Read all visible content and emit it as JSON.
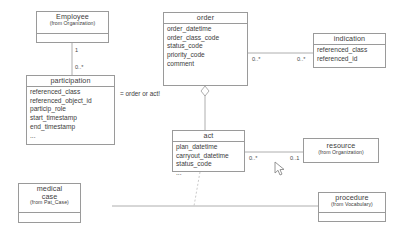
{
  "diagram": {
    "note": "= order or act!",
    "line_color": "#9a9a9a",
    "text_color": "#3c3c3c",
    "background": "#ffffff"
  },
  "classes": {
    "employee": {
      "name": "Employee",
      "stereotype": "(from Organization)",
      "attributes": []
    },
    "participation": {
      "name": "participation",
      "stereotype": "",
      "attributes": [
        "referenced_class",
        "referenced_object_id",
        "particip_role",
        "start_timestamp",
        "end_timestamp",
        "..."
      ]
    },
    "order": {
      "name": "order",
      "stereotype": "",
      "attributes": [
        "order_datetime",
        "order_class_code",
        "status_code",
        "priority_code",
        "comment"
      ]
    },
    "indication": {
      "name": "indication",
      "stereotype": "",
      "attributes": [
        "referenced_class",
        "referenced_id"
      ]
    },
    "act": {
      "name": "act",
      "stereotype": "",
      "attributes": [
        "plan_datetime",
        "carryout_datetime",
        "status_code",
        "..."
      ]
    },
    "resource": {
      "name": "resource",
      "stereotype": "(from Organization)",
      "attributes": []
    },
    "medical_case": {
      "name_line1": "medical",
      "name_line2": "case",
      "stereotype": "(from Pat_Case)",
      "attributes": []
    },
    "procedure": {
      "name": "procedure",
      "stereotype": "(from Vocabulary)",
      "attributes": []
    }
  },
  "multiplicities": {
    "employee_end": "1",
    "participation_end": "0..*",
    "order_to_indication": "0..*",
    "indication_to_order": "0..*",
    "act_to_resource": "0..*",
    "resource_to_act": "0..1"
  }
}
